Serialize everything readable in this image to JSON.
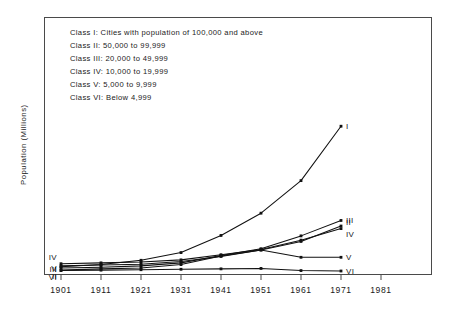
{
  "chart_data": {
    "type": "line",
    "title": "",
    "xlabel": "",
    "ylabel": "Population (Millions)",
    "x": [
      1901,
      1911,
      1921,
      1931,
      1941,
      1951,
      1961,
      1971
    ],
    "xlim": [
      1901,
      1981
    ],
    "ylim": [
      0,
      60
    ],
    "grid": false,
    "legend_position": "inside-top-left",
    "xticks": [
      "1901",
      "1911",
      "1921",
      "1931",
      "1941",
      "1951",
      "1961",
      "1971",
      "1981"
    ],
    "series": [
      {
        "name": "I",
        "label_left": "I",
        "label_right": "I",
        "values": [
          1.7,
          2.2,
          3.2,
          5.0,
          9.0,
          14.2,
          21.8,
          34.5
        ]
      },
      {
        "name": "II",
        "label_left": "II",
        "label_right": "II",
        "values": [
          0.9,
          1.2,
          1.4,
          2.2,
          4.2,
          5.6,
          7.6,
          11.2
        ]
      },
      {
        "name": "III",
        "label_left": "III",
        "label_right": "III",
        "values": [
          1.4,
          1.6,
          1.9,
          2.6,
          4.3,
          5.9,
          8.9,
          12.5
        ]
      },
      {
        "name": "IV",
        "label_left": "IV",
        "label_right": "IV",
        "values": [
          2.4,
          2.6,
          2.8,
          3.3,
          4.5,
          5.7,
          7.9,
          10.6
        ]
      },
      {
        "name": "V",
        "label_left": "V",
        "label_right": "V",
        "values": [
          1.9,
          2.1,
          2.3,
          2.9,
          4.1,
          5.6,
          3.9,
          3.9
        ]
      },
      {
        "name": "VI",
        "label_left": "VI",
        "label_right": "VI",
        "values": [
          0.8,
          0.9,
          1.0,
          1.1,
          1.2,
          1.3,
          0.8,
          0.7
        ]
      }
    ],
    "legend": [
      "Class I: Cities with population of 100,000 and above",
      "Class II: 50,000 to 99,999",
      "Class III: 20,000 to 49,999",
      "Class IV: 10,000 to 19,999",
      "Class V: 5,000 to 9,999",
      "Class VI: Below 4,999"
    ]
  }
}
